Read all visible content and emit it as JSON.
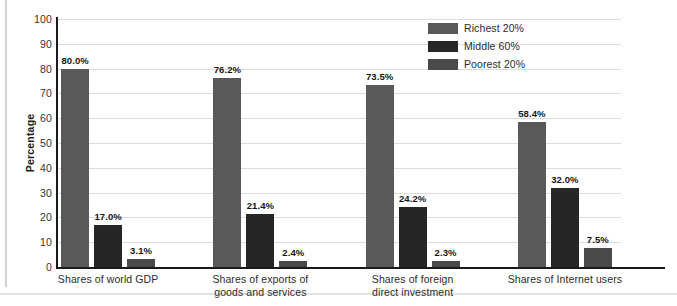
{
  "chart_data": {
    "type": "bar",
    "title": "",
    "subtitle": "",
    "xlabel": "",
    "ylabel": "Percentage",
    "ylim": [
      0,
      100
    ],
    "ytick_step": 10,
    "yticks": [
      100,
      90,
      80,
      70,
      60,
      50,
      40,
      30,
      20,
      10,
      0
    ],
    "grid": true,
    "legend_position": "top-right",
    "categories": [
      "Shares of world GDP",
      "Shares of exports of goods and services",
      "Shares of foreign direct investment",
      "Shares of Internet users"
    ],
    "category_lines": [
      [
        "Shares of world GDP"
      ],
      [
        "Shares of exports of",
        "goods and services"
      ],
      [
        "Shares of foreign",
        "direct investment"
      ],
      [
        "Shares of Internet users"
      ]
    ],
    "series": [
      {
        "name": "Richest 20%",
        "color": "#595959",
        "values": [
          80.0,
          76.2,
          73.5,
          58.4
        ],
        "labels": [
          "80.0%",
          "76.2%",
          "73.5%",
          "58.4%"
        ]
      },
      {
        "name": "Middle 60%",
        "color": "#262626",
        "values": [
          17.0,
          21.4,
          24.2,
          32.0
        ],
        "labels": [
          "17.0%",
          "21.4%",
          "24.2%",
          "32.0%"
        ]
      },
      {
        "name": "Poorest 20%",
        "color": "#4a4a4a",
        "values": [
          3.1,
          2.4,
          2.3,
          7.5
        ],
        "labels": [
          "3.1%",
          "2.4%",
          "2.3%",
          "7.5%"
        ]
      }
    ]
  },
  "legend": {
    "items": [
      {
        "label": "Richest 20%",
        "color": "#595959"
      },
      {
        "label": "Middle 60%",
        "color": "#262626"
      },
      {
        "label": "Poorest 20%",
        "color": "#4a4a4a"
      }
    ]
  },
  "axis": {
    "y_title": "Percentage"
  }
}
